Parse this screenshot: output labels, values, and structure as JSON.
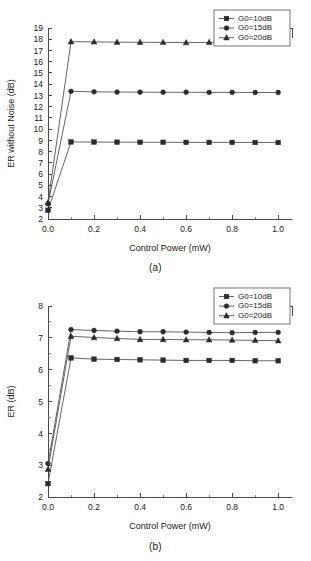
{
  "figure": {
    "background": "#ffffff",
    "line_color": "#555555",
    "marker_color": "#2b2b2b",
    "axis_color": "#4a4a4a"
  },
  "panels": [
    {
      "id": "a",
      "caption": "(a)",
      "chart_data": {
        "type": "line",
        "title": "",
        "xlabel": "Control Power (mW)",
        "ylabel": "ER without Noise (dB)",
        "xlim": [
          0.0,
          1.06
        ],
        "ylim": [
          2,
          19
        ],
        "xticks": [
          0.0,
          0.2,
          0.4,
          0.6,
          0.8,
          1.0
        ],
        "xticklabels": [
          "0.0",
          "0.2",
          "0.4",
          "0.6",
          "0.8",
          "1.0"
        ],
        "xminorticks": [
          0.1,
          0.3,
          0.5,
          0.7,
          0.9
        ],
        "yticks": [
          2,
          3,
          4,
          5,
          6,
          7,
          8,
          9,
          10,
          11,
          12,
          13,
          14,
          15,
          16,
          17,
          18,
          19
        ],
        "yticklabels": [
          "2",
          "3",
          "4",
          "5",
          "6",
          "7",
          "8",
          "9",
          "10",
          "11",
          "12",
          "13",
          "14",
          "15",
          "16",
          "17",
          "18",
          "19"
        ],
        "grid": false,
        "legend_position": "top-right",
        "x": [
          0.0,
          0.1,
          0.2,
          0.3,
          0.4,
          0.5,
          0.6,
          0.7,
          0.8,
          0.9,
          1.0
        ],
        "series": [
          {
            "name": "G0=10dB",
            "marker": "square",
            "values": [
              2.78,
              8.86,
              8.85,
              8.84,
              8.83,
              8.83,
              8.82,
              8.82,
              8.82,
              8.81,
              8.81
            ]
          },
          {
            "name": "G0=15dB",
            "marker": "circle",
            "values": [
              3.35,
              13.36,
              13.32,
              13.3,
              13.29,
              13.28,
              13.28,
              13.27,
              13.27,
              13.26,
              13.26
            ]
          },
          {
            "name": "G0=20dB",
            "marker": "triangle",
            "values": [
              3.45,
              17.78,
              17.77,
              17.74,
              17.73,
              17.72,
              17.7,
              17.72,
              17.7,
              17.7,
              17.69
            ]
          }
        ]
      }
    },
    {
      "id": "b",
      "caption": "(b)",
      "chart_data": {
        "type": "line",
        "title": "",
        "xlabel": "Control Power (mW)",
        "ylabel": "ER (dB)",
        "xlim": [
          0.0,
          1.06
        ],
        "ylim": [
          2,
          8
        ],
        "xticks": [
          0.0,
          0.2,
          0.4,
          0.6,
          0.8,
          1.0
        ],
        "xticklabels": [
          "0.0",
          "0.2",
          "0.4",
          "0.6",
          "0.8",
          "1.0"
        ],
        "xminorticks": [
          0.1,
          0.3,
          0.5,
          0.7,
          0.9
        ],
        "yticks": [
          2,
          3,
          4,
          5,
          6,
          7,
          8
        ],
        "yticklabels": [
          "2",
          "3",
          "4",
          "5",
          "6",
          "7",
          "8"
        ],
        "yminorticks": [
          2.5,
          3.5,
          4.5,
          5.5,
          6.5,
          7.5
        ],
        "grid": false,
        "legend_position": "top-right",
        "x": [
          0.0,
          0.1,
          0.2,
          0.3,
          0.4,
          0.5,
          0.6,
          0.7,
          0.8,
          0.9,
          1.0
        ],
        "series": [
          {
            "name": "G0=10dB",
            "marker": "square",
            "values": [
              2.42,
              6.37,
              6.33,
              6.32,
              6.31,
              6.3,
              6.29,
              6.29,
              6.29,
              6.28,
              6.28
            ]
          },
          {
            "name": "G0=15dB",
            "marker": "circle",
            "values": [
              3.05,
              7.26,
              7.23,
              7.21,
              7.19,
              7.19,
              7.18,
              7.17,
              7.16,
              7.17,
              7.17
            ]
          },
          {
            "name": "G0=20dB",
            "marker": "triangle",
            "values": [
              2.87,
              7.05,
              7.01,
              6.98,
              6.95,
              6.95,
              6.94,
              6.94,
              6.93,
              6.92,
              6.91
            ]
          }
        ]
      }
    }
  ]
}
